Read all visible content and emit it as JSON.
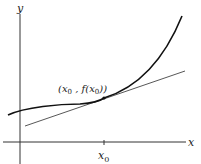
{
  "diagram": {
    "axes": {
      "x_label": "x",
      "y_label": "y",
      "x_tick_label": "x",
      "x_tick_subscript": "0"
    },
    "point_label": {
      "open": "(x",
      "sub1": "0",
      "mid": " , f(x",
      "sub2": "0",
      "close": "))"
    },
    "colors": {
      "curve": "#111111",
      "tangent": "#444444",
      "axes": "#333333"
    }
  }
}
